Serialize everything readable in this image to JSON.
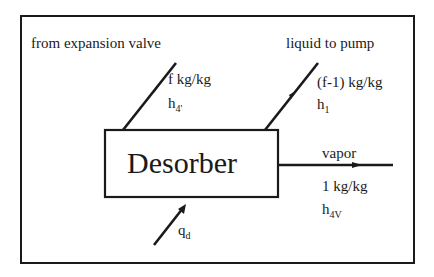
{
  "diagram": {
    "component": {
      "label": "Desorber"
    },
    "inlet_from_valve": {
      "heading": "from expansion valve",
      "flow": "f kg/kg",
      "enthalpy_base": "h",
      "enthalpy_sub": "4'"
    },
    "outlet_liquid": {
      "heading": "liquid to pump",
      "flow": "(f-1) kg/kg",
      "enthalpy_base": "h",
      "enthalpy_sub": "1"
    },
    "outlet_vapor": {
      "heading": "vapor",
      "flow": "1 kg/kg",
      "enthalpy_base": "h",
      "enthalpy_sub": "4V"
    },
    "heat_input": {
      "symbol_base": "q",
      "symbol_sub": "d"
    },
    "colors": {
      "line": "#1a1a1a",
      "background": "#ffffff"
    }
  }
}
